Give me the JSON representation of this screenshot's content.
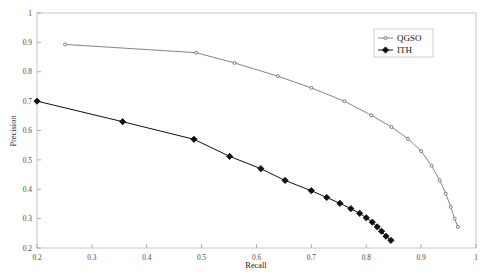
{
  "chart_data": {
    "type": "line",
    "title": "",
    "xlabel": "Recall",
    "ylabel": "Precision",
    "xlim": [
      0.2,
      1.0
    ],
    "ylim": [
      0.2,
      1.0
    ],
    "xticks": [
      0.2,
      0.3,
      0.4,
      0.5,
      0.6,
      0.7,
      0.8,
      0.9,
      1.0
    ],
    "xtick_labels": [
      "0.2",
      "0.3",
      "0.4",
      "0.5",
      "0.6",
      "0.7",
      "0.8",
      "0.9",
      "1"
    ],
    "yticks": [
      0.2,
      0.3,
      0.4,
      0.5,
      0.6,
      0.7,
      0.8,
      0.9,
      1.0
    ],
    "ytick_labels": [
      "0.2",
      "0.3",
      "0.4",
      "0.5",
      "0.6",
      "0.7",
      "0.8",
      "0.9",
      "1"
    ],
    "grid": false,
    "legend_position": "top-right",
    "series": [
      {
        "name": "QGSO",
        "color": "#6e6e6e",
        "marker": "circle",
        "marker_filled": false,
        "x": [
          0.251,
          0.49,
          0.56,
          0.639,
          0.7,
          0.76,
          0.809,
          0.846,
          0.876,
          0.9,
          0.919,
          0.934,
          0.945,
          0.954,
          0.961,
          0.967
        ],
        "y": [
          0.893,
          0.865,
          0.83,
          0.785,
          0.745,
          0.7,
          0.652,
          0.612,
          0.572,
          0.53,
          0.48,
          0.43,
          0.385,
          0.34,
          0.3,
          0.272
        ]
      },
      {
        "name": "ITH",
        "color": "#101010",
        "marker": "diamond",
        "marker_filled": true,
        "x": [
          0.2,
          0.356,
          0.486,
          0.551,
          0.608,
          0.652,
          0.7,
          0.728,
          0.752,
          0.772,
          0.788,
          0.8,
          0.811,
          0.82,
          0.828,
          0.836,
          0.845
        ],
        "y": [
          0.7,
          0.63,
          0.57,
          0.512,
          0.47,
          0.43,
          0.395,
          0.372,
          0.352,
          0.334,
          0.318,
          0.303,
          0.288,
          0.272,
          0.257,
          0.24,
          0.226
        ]
      }
    ]
  },
  "axes": {
    "xlabel": "Recall",
    "ylabel": "Precision"
  },
  "legend": {
    "entries": [
      {
        "label": "QGSO"
      },
      {
        "label": "ITH"
      }
    ]
  }
}
